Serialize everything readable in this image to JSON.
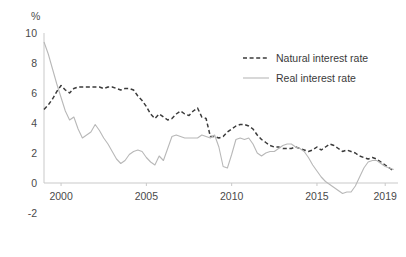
{
  "chart_data": {
    "type": "line",
    "title": "",
    "subtitle": "",
    "xlabel": "",
    "ylabel": "%",
    "unit_label": "%",
    "xlim": [
      1999.0,
      2019.75
    ],
    "ylim": [
      -2,
      10
    ],
    "grid": false,
    "legend_position": "top-right",
    "xticks": [
      2000,
      2005,
      2010,
      2015,
      2019
    ],
    "xticklabels": [
      "2000",
      "2005",
      "2010",
      "2015",
      "2019"
    ],
    "yticks": [
      -2,
      0,
      2,
      4,
      6,
      8,
      10
    ],
    "yticklabels": [
      "-2",
      "0",
      "2",
      "4",
      "6",
      "8",
      "10"
    ],
    "colors": {
      "natural": "#3b3b3b",
      "real": "#b8b8b8",
      "axis": "#c9c9c9",
      "text": "#4a4a4a"
    },
    "series": [
      {
        "name": "Natural interest rate",
        "style": "dashed",
        "color": "#3b3b3b",
        "x": [
          1999.0,
          1999.25,
          1999.5,
          1999.75,
          2000.0,
          2000.25,
          2000.5,
          2000.75,
          2001.0,
          2001.25,
          2001.5,
          2001.75,
          2002.0,
          2002.25,
          2002.5,
          2002.75,
          2003.0,
          2003.25,
          2003.5,
          2003.75,
          2004.0,
          2004.25,
          2004.5,
          2004.75,
          2005.0,
          2005.25,
          2005.5,
          2005.75,
          2006.0,
          2006.25,
          2006.5,
          2006.75,
          2007.0,
          2007.25,
          2007.5,
          2007.75,
          2008.0,
          2008.25,
          2008.5,
          2008.75,
          2009.0,
          2009.25,
          2009.5,
          2009.75,
          2010.0,
          2010.25,
          2010.5,
          2010.75,
          2011.0,
          2011.25,
          2011.5,
          2011.75,
          2012.0,
          2012.25,
          2012.5,
          2012.75,
          2013.0,
          2013.25,
          2013.5,
          2013.75,
          2014.0,
          2014.25,
          2014.5,
          2014.75,
          2015.0,
          2015.25,
          2015.5,
          2015.75,
          2016.0,
          2016.25,
          2016.5,
          2016.75,
          2017.0,
          2017.25,
          2017.5,
          2017.75,
          2018.0,
          2018.25,
          2018.5,
          2018.75,
          2019.0,
          2019.25,
          2019.5
        ],
        "values": [
          4.9,
          5.2,
          5.6,
          6.1,
          6.5,
          6.2,
          6.0,
          6.3,
          6.4,
          6.4,
          6.4,
          6.4,
          6.4,
          6.4,
          6.3,
          6.4,
          6.4,
          6.3,
          6.2,
          6.3,
          6.3,
          6.2,
          5.8,
          5.5,
          5.1,
          4.6,
          4.3,
          4.6,
          4.4,
          4.2,
          4.3,
          4.6,
          4.8,
          4.6,
          4.5,
          4.8,
          5.0,
          4.4,
          4.3,
          3.1,
          3.1,
          3.0,
          3.1,
          3.4,
          3.6,
          3.8,
          3.9,
          3.9,
          3.8,
          3.6,
          3.2,
          2.9,
          2.7,
          2.5,
          2.4,
          2.4,
          2.3,
          2.3,
          2.3,
          2.4,
          2.3,
          2.2,
          2.1,
          2.2,
          2.4,
          2.2,
          2.4,
          2.6,
          2.5,
          2.3,
          2.1,
          2.2,
          2.1,
          2.0,
          1.8,
          1.7,
          1.6,
          1.7,
          1.6,
          1.4,
          1.2,
          1.0,
          0.8
        ]
      },
      {
        "name": "Real interest rate",
        "style": "solid",
        "color": "#b8b8b8",
        "x": [
          1999.0,
          1999.25,
          1999.5,
          1999.75,
          2000.0,
          2000.25,
          2000.5,
          2000.75,
          2001.0,
          2001.25,
          2001.5,
          2001.75,
          2002.0,
          2002.25,
          2002.5,
          2002.75,
          2003.0,
          2003.25,
          2003.5,
          2003.75,
          2004.0,
          2004.25,
          2004.5,
          2004.75,
          2005.0,
          2005.25,
          2005.5,
          2005.75,
          2006.0,
          2006.25,
          2006.5,
          2006.75,
          2007.0,
          2007.25,
          2007.5,
          2007.75,
          2008.0,
          2008.25,
          2008.5,
          2008.75,
          2009.0,
          2009.25,
          2009.5,
          2009.75,
          2010.0,
          2010.25,
          2010.5,
          2010.75,
          2011.0,
          2011.25,
          2011.5,
          2011.75,
          2012.0,
          2012.25,
          2012.5,
          2012.75,
          2013.0,
          2013.25,
          2013.5,
          2013.75,
          2014.0,
          2014.25,
          2014.5,
          2014.75,
          2015.0,
          2015.25,
          2015.5,
          2015.75,
          2016.0,
          2016.25,
          2016.5,
          2016.75,
          2017.0,
          2017.25,
          2017.5,
          2017.75,
          2018.0,
          2018.25,
          2018.5,
          2018.75,
          2019.0,
          2019.25,
          2019.5
        ],
        "values": [
          9.4,
          8.6,
          7.6,
          6.6,
          5.7,
          4.8,
          4.2,
          4.4,
          3.6,
          3.0,
          3.2,
          3.4,
          3.9,
          3.5,
          3.0,
          2.6,
          2.1,
          1.6,
          1.3,
          1.5,
          1.9,
          2.1,
          2.2,
          2.1,
          1.7,
          1.4,
          1.2,
          1.8,
          1.5,
          2.3,
          3.1,
          3.2,
          3.1,
          3.0,
          3.0,
          3.0,
          3.0,
          3.2,
          3.1,
          3.0,
          3.2,
          2.4,
          1.1,
          1.0,
          1.9,
          2.9,
          3.0,
          2.9,
          3.0,
          2.6,
          2.0,
          1.8,
          2.0,
          2.1,
          2.1,
          2.3,
          2.5,
          2.6,
          2.6,
          2.4,
          2.3,
          2.1,
          1.7,
          1.2,
          0.8,
          0.4,
          0.1,
          -0.1,
          -0.3,
          -0.5,
          -0.7,
          -0.6,
          -0.6,
          -0.2,
          0.4,
          1.0,
          1.4,
          1.5,
          1.5,
          1.3,
          1.1,
          1.0,
          0.9
        ]
      }
    ]
  },
  "legend": {
    "items": [
      {
        "label": "Natural interest rate",
        "style": "dashed"
      },
      {
        "label": "Real interest rate",
        "style": "solid"
      }
    ]
  }
}
